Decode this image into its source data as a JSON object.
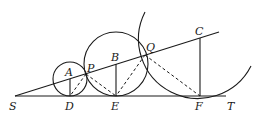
{
  "diagram": {
    "type": "geometry",
    "points": {
      "S": {
        "label": "S",
        "x": 15,
        "y": 96
      },
      "A": {
        "label": "A",
        "x": 70,
        "y": 79
      },
      "B": {
        "label": "B",
        "x": 116,
        "y": 64
      },
      "C": {
        "label": "C",
        "x": 200,
        "y": 38
      },
      "D": {
        "label": "D",
        "x": 70,
        "y": 96
      },
      "E": {
        "label": "E",
        "x": 116,
        "y": 96
      },
      "F": {
        "label": "F",
        "x": 200,
        "y": 96
      },
      "P": {
        "label": "P",
        "x": 86,
        "y": 74
      },
      "Q": {
        "label": "Q",
        "x": 145,
        "y": 55
      },
      "T": {
        "label": "T",
        "x": 226,
        "y": 96
      }
    },
    "labels": {
      "S": "S",
      "A": "A",
      "B": "B",
      "C": "C",
      "D": "D",
      "E": "E",
      "F": "F",
      "P": "P",
      "Q": "Q",
      "T": "T"
    },
    "circles": [
      {
        "name": "circle-A",
        "center": "A",
        "radius": 17
      },
      {
        "name": "circle-B",
        "center": "B",
        "radius": 32
      },
      {
        "name": "arc-C",
        "center": "C",
        "radius": 58,
        "partial": true
      }
    ],
    "solid_segments": [
      "S-T",
      "S-C",
      "A-D",
      "B-E",
      "C-F"
    ],
    "dashed_segments": [
      "P-D",
      "P-E",
      "Q-E",
      "Q-F"
    ]
  }
}
